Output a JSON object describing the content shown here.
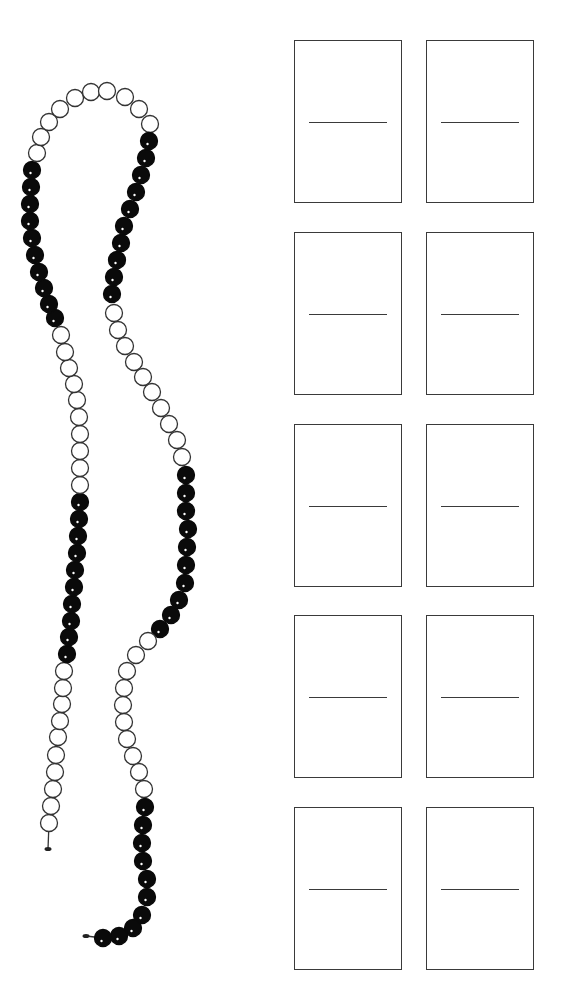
{
  "worksheet": {
    "bead_chain": {
      "total_beads": 100,
      "group_size": 10,
      "colors": {
        "dark": "#0a0a0a",
        "light": "#ffffff",
        "stroke": "#333333",
        "highlight": "#ffffff"
      },
      "bead_radius": 8.5,
      "start_knot": {
        "x": 48,
        "y": 849
      },
      "end_knot": {
        "x": 86,
        "y": 936
      },
      "groups": [
        {
          "color": "light",
          "beads": [
            [
              49,
              823
            ],
            [
              51,
              806
            ],
            [
              53,
              789
            ],
            [
              55,
              772
            ],
            [
              56,
              755
            ],
            [
              58,
              737
            ],
            [
              60,
              721
            ],
            [
              62,
              704
            ],
            [
              63,
              688
            ],
            [
              64,
              671
            ]
          ]
        },
        {
          "color": "dark",
          "beads": [
            [
              67,
              654
            ],
            [
              69,
              637
            ],
            [
              71,
              621
            ],
            [
              72,
              604
            ],
            [
              74,
              587
            ],
            [
              75,
              570
            ],
            [
              77,
              553
            ],
            [
              78,
              536
            ],
            [
              79,
              519
            ],
            [
              80,
              502
            ]
          ]
        },
        {
          "color": "light",
          "beads": [
            [
              80,
              485
            ],
            [
              80,
              468
            ],
            [
              80,
              451
            ],
            [
              80,
              434
            ],
            [
              79,
              417
            ],
            [
              77,
              400
            ],
            [
              74,
              384
            ],
            [
              69,
              368
            ],
            [
              65,
              352
            ],
            [
              61,
              335
            ]
          ]
        },
        {
          "color": "dark",
          "beads": [
            [
              55,
              318
            ],
            [
              49,
              304
            ],
            [
              44,
              288
            ],
            [
              39,
              272
            ],
            [
              35,
              255
            ],
            [
              32,
              238
            ],
            [
              30,
              221
            ],
            [
              30,
              204
            ],
            [
              31,
              187
            ],
            [
              32,
              170
            ]
          ]
        },
        {
          "color": "light",
          "beads": [
            [
              37,
              153
            ],
            [
              41,
              137
            ],
            [
              49,
              122
            ],
            [
              60,
              109
            ],
            [
              75,
              98
            ],
            [
              91,
              92
            ],
            [
              107,
              91
            ],
            [
              125,
              97
            ],
            [
              139,
              109
            ],
            [
              150,
              124
            ]
          ]
        },
        {
          "color": "dark",
          "beads": [
            [
              149,
              141
            ],
            [
              146,
              158
            ],
            [
              141,
              175
            ],
            [
              136,
              192
            ],
            [
              130,
              209
            ],
            [
              124,
              226
            ],
            [
              121,
              243
            ],
            [
              117,
              260
            ],
            [
              114,
              277
            ],
            [
              112,
              294
            ]
          ]
        },
        {
          "color": "light",
          "beads": [
            [
              114,
              313
            ],
            [
              118,
              330
            ],
            [
              125,
              346
            ],
            [
              134,
              362
            ],
            [
              143,
              377
            ],
            [
              152,
              392
            ],
            [
              161,
              408
            ],
            [
              169,
              424
            ],
            [
              177,
              440
            ],
            [
              182,
              457
            ]
          ]
        },
        {
          "color": "dark",
          "beads": [
            [
              186,
              475
            ],
            [
              186,
              493
            ],
            [
              186,
              511
            ],
            [
              188,
              529
            ],
            [
              187,
              547
            ],
            [
              186,
              565
            ],
            [
              185,
              583
            ],
            [
              179,
              600
            ],
            [
              171,
              615
            ],
            [
              160,
              629
            ]
          ]
        },
        {
          "color": "light",
          "beads": [
            [
              148,
              641
            ],
            [
              136,
              655
            ],
            [
              127,
              671
            ],
            [
              124,
              688
            ],
            [
              123,
              705
            ],
            [
              124,
              722
            ],
            [
              127,
              739
            ],
            [
              133,
              756
            ],
            [
              139,
              772
            ],
            [
              144,
              789
            ]
          ]
        },
        {
          "color": "dark",
          "beads": [
            [
              145,
              807
            ],
            [
              143,
              825
            ],
            [
              142,
              843
            ],
            [
              143,
              861
            ],
            [
              147,
              879
            ],
            [
              147,
              897
            ],
            [
              142,
              915
            ],
            [
              133,
              928
            ],
            [
              119,
              936
            ],
            [
              103,
              938
            ]
          ]
        }
      ]
    },
    "answer_boxes": {
      "border_color": "#3a3a3a",
      "rows": [
        {
          "top": 40,
          "boxes": [
            {
              "id": 1,
              "top_value": "",
              "bottom_value": ""
            },
            {
              "id": 2,
              "top_value": "",
              "bottom_value": ""
            }
          ]
        },
        {
          "top": 232,
          "boxes": [
            {
              "id": 3,
              "top_value": "",
              "bottom_value": ""
            },
            {
              "id": 4,
              "top_value": "",
              "bottom_value": ""
            }
          ]
        },
        {
          "top": 424,
          "boxes": [
            {
              "id": 5,
              "top_value": "",
              "bottom_value": ""
            },
            {
              "id": 6,
              "top_value": "",
              "bottom_value": ""
            }
          ]
        },
        {
          "top": 615,
          "boxes": [
            {
              "id": 7,
              "top_value": "",
              "bottom_value": ""
            },
            {
              "id": 8,
              "top_value": "",
              "bottom_value": ""
            }
          ]
        },
        {
          "top": 807,
          "boxes": [
            {
              "id": 9,
              "top_value": "",
              "bottom_value": ""
            },
            {
              "id": 10,
              "top_value": "",
              "bottom_value": ""
            }
          ]
        }
      ],
      "columns_left": [
        294,
        426
      ]
    }
  }
}
